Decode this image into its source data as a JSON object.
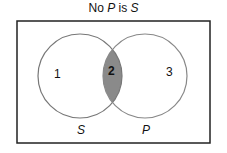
{
  "title": {
    "prefix": "No ",
    "term1": "P",
    "mid": " is ",
    "term2": "S"
  },
  "regions": [
    {
      "label": "1",
      "shaded": false
    },
    {
      "label": "2",
      "shaded": true
    },
    {
      "label": "3",
      "shaded": false
    }
  ],
  "circles": [
    {
      "label": "S"
    },
    {
      "label": "P"
    }
  ],
  "colors": {
    "shade": "#8a8a8a",
    "stroke": "#777777",
    "border": "#222222"
  }
}
